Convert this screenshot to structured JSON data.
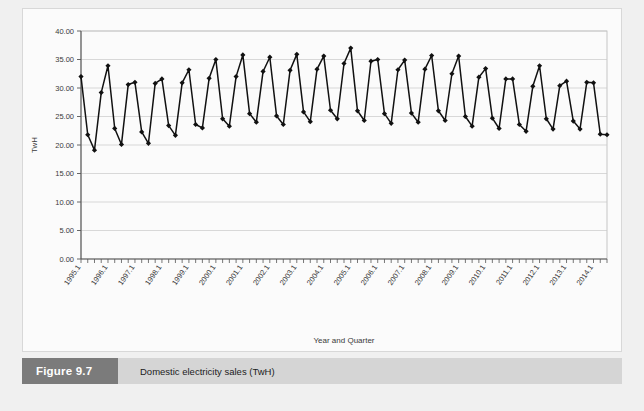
{
  "caption": {
    "number": "Figure 9.7",
    "text": "Domestic electricity sales (TwH)"
  },
  "chart_data": {
    "type": "line",
    "title": "",
    "xlabel": "Year and Quarter",
    "ylabel": "TwH",
    "ylim": [
      0,
      40
    ],
    "ytick_step": 5,
    "grid": true,
    "legend": false,
    "marker": "diamond",
    "line_color": "#111111",
    "marker_color": "#111111",
    "ytick_labels": [
      "0.00",
      "5.00",
      "10.00",
      "15.00",
      "20.00",
      "25.00",
      "30.00",
      "35.00",
      "40.00"
    ],
    "ytick_values": [
      0,
      5,
      10,
      15,
      20,
      25,
      30,
      35,
      40
    ],
    "xtick_labels": [
      "1995.1",
      "1996.1",
      "1997.1",
      "1998.1",
      "1999.1",
      "2000.1",
      "2001.1",
      "2002.1",
      "2003.1",
      "2004.1",
      "2005.1",
      "2006.1",
      "2007.1",
      "2008.1",
      "2009.1",
      "2010.1",
      "2011.1",
      "2012.1",
      "2013.1",
      "2014.1"
    ],
    "x": [
      "1995.1",
      "1995.2",
      "1995.3",
      "1995.4",
      "1996.1",
      "1996.2",
      "1996.3",
      "1996.4",
      "1997.1",
      "1997.2",
      "1997.3",
      "1997.4",
      "1998.1",
      "1998.2",
      "1998.3",
      "1998.4",
      "1999.1",
      "1999.2",
      "1999.3",
      "1999.4",
      "2000.1",
      "2000.2",
      "2000.3",
      "2000.4",
      "2001.1",
      "2001.2",
      "2001.3",
      "2001.4",
      "2002.1",
      "2002.2",
      "2002.3",
      "2002.4",
      "2003.1",
      "2003.2",
      "2003.3",
      "2003.4",
      "2004.1",
      "2004.2",
      "2004.3",
      "2004.4",
      "2005.1",
      "2005.2",
      "2005.3",
      "2005.4",
      "2006.1",
      "2006.2",
      "2006.3",
      "2006.4",
      "2007.1",
      "2007.2",
      "2007.3",
      "2007.4",
      "2008.1",
      "2008.2",
      "2008.3",
      "2008.4",
      "2009.1",
      "2009.2",
      "2009.3",
      "2009.4",
      "2010.1",
      "2010.2",
      "2010.3",
      "2010.4",
      "2011.1",
      "2011.2",
      "2011.3",
      "2011.4",
      "2012.1",
      "2012.2",
      "2012.3",
      "2012.4",
      "2013.1",
      "2013.2",
      "2013.3",
      "2013.4",
      "2014.1",
      "2014.2",
      "2014.3"
    ],
    "values": [
      32.0,
      21.8,
      19.1,
      29.2,
      33.9,
      22.9,
      20.1,
      30.6,
      31.0,
      22.3,
      20.3,
      30.8,
      31.6,
      23.4,
      21.7,
      30.9,
      33.2,
      23.6,
      23.0,
      31.7,
      35.0,
      24.6,
      23.3,
      32.0,
      35.8,
      25.5,
      24.0,
      32.9,
      35.4,
      25.1,
      23.6,
      33.1,
      35.9,
      25.8,
      24.1,
      33.3,
      35.6,
      26.1,
      24.6,
      34.3,
      37.0,
      26.0,
      24.3,
      34.7,
      35.0,
      25.5,
      23.8,
      33.2,
      34.9,
      25.6,
      24.0,
      33.3,
      35.7,
      26.0,
      24.3,
      32.5,
      35.6,
      25.0,
      23.3,
      31.9,
      33.4,
      24.7,
      22.9,
      31.6,
      31.6,
      23.6,
      22.4,
      30.3,
      33.9,
      24.6,
      22.8,
      30.4,
      31.2,
      24.2,
      22.8,
      31.0,
      30.9,
      21.9,
      21.8
    ]
  }
}
